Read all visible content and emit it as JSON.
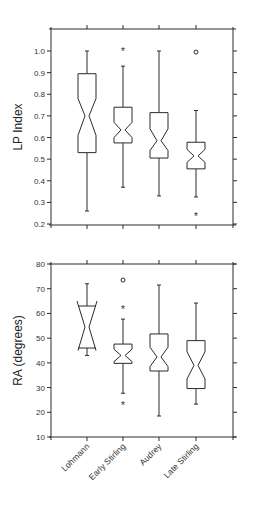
{
  "chart_data": [
    {
      "type": "boxplot",
      "title": "",
      "xlabel": "",
      "ylabel": "LP Index",
      "ylim": [
        0.2,
        1.08
      ],
      "yticks": [
        0.2,
        0.3,
        0.4,
        0.5,
        0.6,
        0.7,
        0.8,
        0.9,
        1.0
      ],
      "ytick_labels": [
        "0.2",
        "0.3",
        "0.4",
        "0.5",
        "0.6",
        "0.7",
        "0.8",
        "0.9",
        "1.0"
      ],
      "notched": true,
      "categories": [
        "Lohmann",
        "Early Stirling",
        "Audrey",
        "Late Stirling"
      ],
      "series": [
        {
          "name": "Lohmann",
          "min": 0.26,
          "q1": 0.53,
          "median": 0.7,
          "q3": 0.895,
          "max": 1.0,
          "notch_low": 0.61,
          "notch_high": 0.78,
          "outliers": []
        },
        {
          "name": "Early Stirling",
          "min": 0.37,
          "q1": 0.575,
          "median": 0.635,
          "q3": 0.74,
          "max": 0.93,
          "notch_low": 0.6,
          "notch_high": 0.67,
          "outliers": [
            {
              "value": 1.0,
              "marker": "*"
            }
          ]
        },
        {
          "name": "Audrey",
          "min": 0.33,
          "q1": 0.505,
          "median": 0.585,
          "q3": 0.715,
          "max": 1.0,
          "notch_low": 0.54,
          "notch_high": 0.64,
          "outliers": []
        },
        {
          "name": "Late Stirling",
          "min": 0.325,
          "q1": 0.455,
          "median": 0.515,
          "q3": 0.578,
          "max": 0.725,
          "notch_low": 0.485,
          "notch_high": 0.545,
          "outliers": [
            {
              "value": 0.995,
              "marker": "o"
            },
            {
              "value": 0.235,
              "marker": "*"
            }
          ]
        }
      ]
    },
    {
      "type": "boxplot",
      "title": "",
      "xlabel": "",
      "ylabel": "RA (degrees)",
      "ylim": [
        10,
        80
      ],
      "yticks": [
        10,
        20,
        30,
        40,
        50,
        60,
        70,
        80
      ],
      "ytick_labels": [
        "10",
        "20",
        "30",
        "40",
        "50",
        "60",
        "70",
        "80"
      ],
      "notched": true,
      "categories": [
        "Lohmann",
        "Early Stirling",
        "Audrey",
        "Late Stirling"
      ],
      "series": [
        {
          "name": "Lohmann",
          "min": 43,
          "q1": 46,
          "median": 54.5,
          "q3": 63,
          "max": 72,
          "notch_low": 45,
          "notch_high": 65,
          "outliers": []
        },
        {
          "name": "Early Stirling",
          "min": 27.7,
          "q1": 39.8,
          "median": 43,
          "q3": 47.6,
          "max": 57.7,
          "notch_low": 40.5,
          "notch_high": 45.5,
          "outliers": [
            {
              "value": 73.5,
              "marker": "o"
            },
            {
              "value": 61.7,
              "marker": "*"
            },
            {
              "value": 22.9,
              "marker": "*"
            }
          ]
        },
        {
          "name": "Audrey",
          "min": 18.5,
          "q1": 36.7,
          "median": 42.4,
          "q3": 51.7,
          "max": 71.5,
          "notch_low": 38.5,
          "notch_high": 46.3,
          "outliers": []
        },
        {
          "name": "Late Stirling",
          "min": 23.3,
          "q1": 29.6,
          "median": 39,
          "q3": 49,
          "max": 64.2,
          "notch_low": 33.5,
          "notch_high": 44.5,
          "outliers": []
        }
      ]
    }
  ],
  "layout": {
    "plot_x_left": 51,
    "plot_x_right": 233,
    "category_x": [
      87,
      123,
      159,
      196
    ],
    "box_half_width": 9,
    "notch_half_width": 2,
    "charts": [
      {
        "top": 29,
        "bottom": 225,
        "v_top": 1.0,
        "v_top_y": 51,
        "v_bot": 0.2,
        "v_bot_y": 224
      },
      {
        "top": 264,
        "bottom": 437,
        "v_top": 80,
        "v_top_y": 264,
        "v_bot": 10,
        "v_bot_y": 437
      }
    ]
  }
}
